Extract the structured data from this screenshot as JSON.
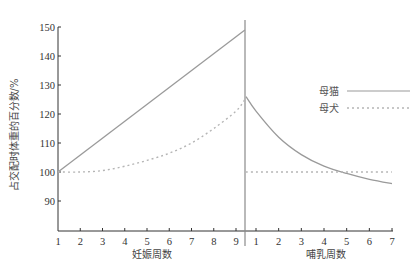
{
  "chart_data": {
    "type": "line",
    "title": "",
    "ylabel": "占交配时体重的百分数/%",
    "ylim": [
      80,
      150
    ],
    "yticks": [
      90,
      100,
      110,
      120,
      130,
      140,
      150
    ],
    "grid": false,
    "legend_position": "right-middle",
    "segments": [
      {
        "name": "gestation",
        "xlabel": "妊娠周数",
        "x_ticks": [
          1,
          2,
          3,
          4,
          5,
          6,
          7,
          8,
          9
        ]
      },
      {
        "name": "lactation",
        "xlabel": "哺乳周数",
        "x_ticks": [
          1,
          2,
          3,
          4,
          5,
          6,
          7
        ]
      }
    ],
    "series": [
      {
        "name": "母猫",
        "style": "solid",
        "gestation": {
          "x": [
            1,
            2,
            3,
            4,
            5,
            6,
            7,
            8,
            9,
            9.4
          ],
          "values": [
            100,
            106,
            112,
            118.5,
            124.5,
            130.5,
            136.5,
            142.5,
            148,
            149
          ]
        },
        "lactation": {
          "x": [
            0.5,
            1,
            2,
            3,
            4,
            5,
            6,
            7
          ],
          "values": [
            126,
            121,
            112,
            106,
            102,
            99.5,
            97.5,
            96
          ]
        }
      },
      {
        "name": "母犬",
        "style": "dotted",
        "gestation": {
          "x": [
            1,
            2,
            3,
            4,
            5,
            6,
            7,
            8,
            9,
            9.4
          ],
          "values": [
            100,
            100,
            100.5,
            102,
            104,
            106.5,
            110,
            115,
            121,
            125
          ]
        },
        "lactation": {
          "x": [
            0.5,
            1,
            2,
            3,
            4,
            5,
            6,
            7
          ],
          "values": [
            100,
            100,
            100,
            100,
            100,
            100,
            100,
            100
          ]
        }
      }
    ]
  },
  "legend": [
    {
      "label": "母猫",
      "style": "solid"
    },
    {
      "label": "母犬",
      "style": "dotted"
    }
  ],
  "colors": {
    "axis": "#333333",
    "line": "#9a9a9a",
    "divider": "#8a8a8a"
  }
}
